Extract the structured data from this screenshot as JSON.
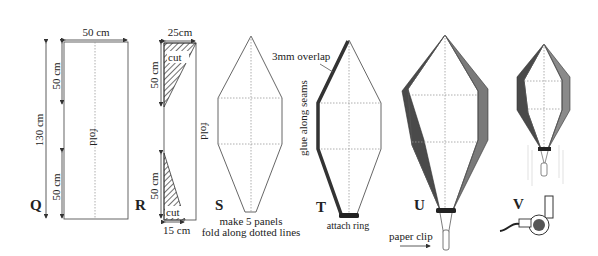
{
  "figures": {
    "Q": {
      "label": "Q",
      "width_dim": "50 cm",
      "height_dim": "130 cm",
      "top_dim": "50 cm",
      "bottom_dim": "50 cm",
      "fold": "fold"
    },
    "R": {
      "label": "R",
      "top_width_dim": "25cm",
      "top_cut": "cut",
      "top_len_dim": "50 cm",
      "bottom_len_dim": "50 cm",
      "bottom_cut": "cut",
      "bottom_width_dim": "15 cm",
      "fold": "fold"
    },
    "S": {
      "label": "S",
      "caption_line1": "make 5 panels",
      "caption_line2": "fold along dotted lines"
    },
    "T": {
      "label": "T",
      "overlap": "3mm overlap",
      "glue": "glue along seams",
      "ring": "attach ring"
    },
    "U": {
      "label": "U",
      "clip": "paper clip"
    },
    "V": {
      "label": "V"
    }
  },
  "colors": {
    "outline": "#555555",
    "seam": "#333333",
    "panel_dark": "#4a4a4a",
    "panel_mid": "#7a7a7a"
  }
}
